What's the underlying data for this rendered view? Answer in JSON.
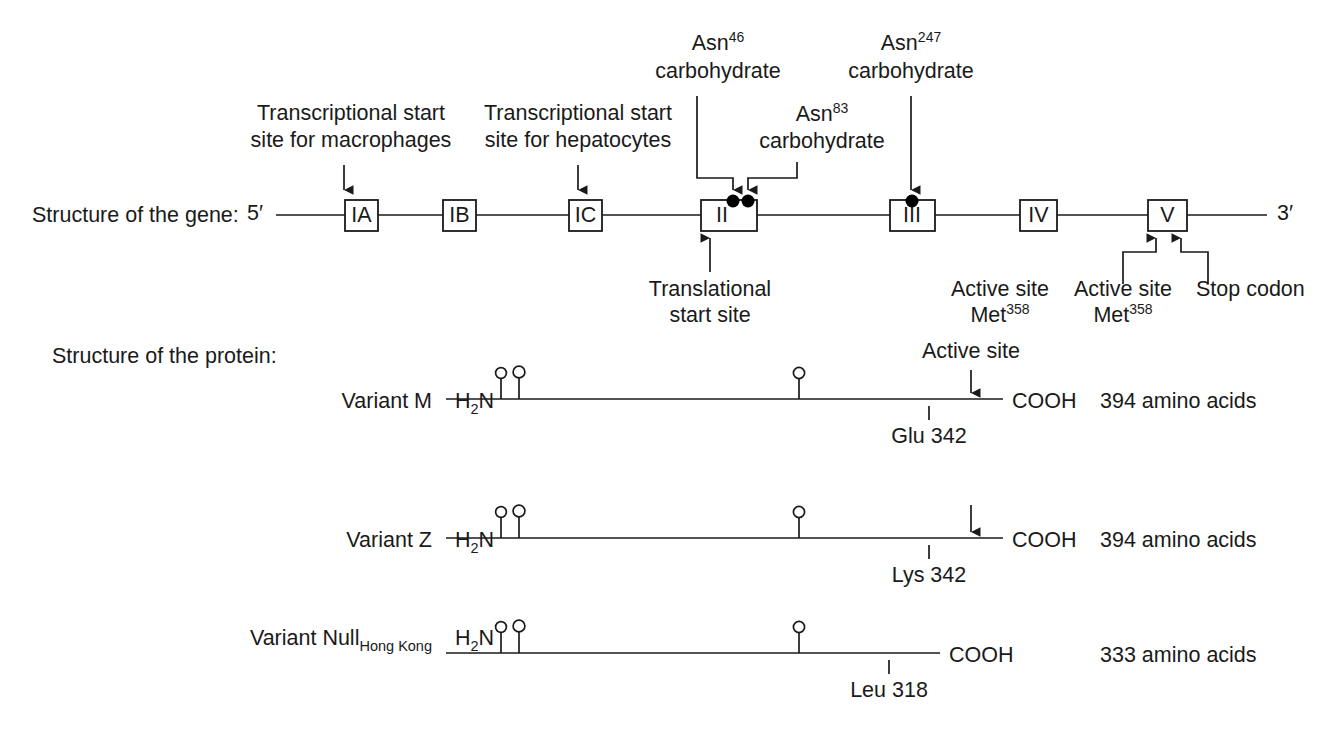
{
  "figure": {
    "background": "#ffffff",
    "ink": "#1a1a1a"
  },
  "gene": {
    "row_label": "Structure of the gene:",
    "five_prime": "5′",
    "three_prime": "3′",
    "exons": [
      {
        "name": "IA",
        "label": "IA"
      },
      {
        "name": "IB",
        "label": "IB"
      },
      {
        "name": "IC",
        "label": "IC"
      },
      {
        "name": "II",
        "label": "II"
      },
      {
        "name": "III",
        "label": "III"
      },
      {
        "name": "IV",
        "label": "IV"
      },
      {
        "name": "V",
        "label": "V"
      }
    ],
    "annotations": {
      "macrophage_start": {
        "line1": "Transcriptional start",
        "line2": "site for macrophages"
      },
      "hepatocyte_start": {
        "line1": "Transcriptional start",
        "line2": "site for hepatocytes"
      },
      "asn46": {
        "line1": "Asn",
        "sup": "46",
        "line2": "carbohydrate"
      },
      "asn83": {
        "line1": "Asn",
        "sup": "83",
        "line2": "carbohydrate"
      },
      "asn247": {
        "line1": "Asn",
        "sup": "247",
        "line2": "carbohydrate"
      },
      "translational_start": {
        "line1": "Translational",
        "line2": "start site"
      },
      "active_site_met_free": {
        "line1": "Active site",
        "line2": "Met",
        "sup": "358"
      },
      "active_site_met_exonv": {
        "line1": "Active site",
        "line2": "Met",
        "sup": "358"
      },
      "stop_codon": {
        "line1": "Stop codon"
      }
    }
  },
  "protein": {
    "row_label": "Structure of the protein:",
    "n_terminus": {
      "main": "H",
      "sub": "2",
      "tail": "N"
    },
    "c_terminus": "COOH",
    "active_site_label": "Active site",
    "variants": [
      {
        "name": "variant-m",
        "label": "Variant M",
        "label_sub": "",
        "length_text": "394 amino acids",
        "residue": "Glu 342",
        "has_active_site_label": true,
        "has_active_site_arrow": true,
        "glycosylation_count": 3
      },
      {
        "name": "variant-z",
        "label": "Variant Z",
        "label_sub": "",
        "length_text": "394 amino acids",
        "residue": "Lys 342",
        "has_active_site_label": false,
        "has_active_site_arrow": true,
        "glycosylation_count": 3
      },
      {
        "name": "variant-null-hong-kong",
        "label": "Variant Null",
        "label_sub": "Hong Kong",
        "length_text": "333 amino acids",
        "residue": "Leu 318",
        "has_active_site_label": false,
        "has_active_site_arrow": false,
        "glycosylation_count": 3
      }
    ]
  }
}
